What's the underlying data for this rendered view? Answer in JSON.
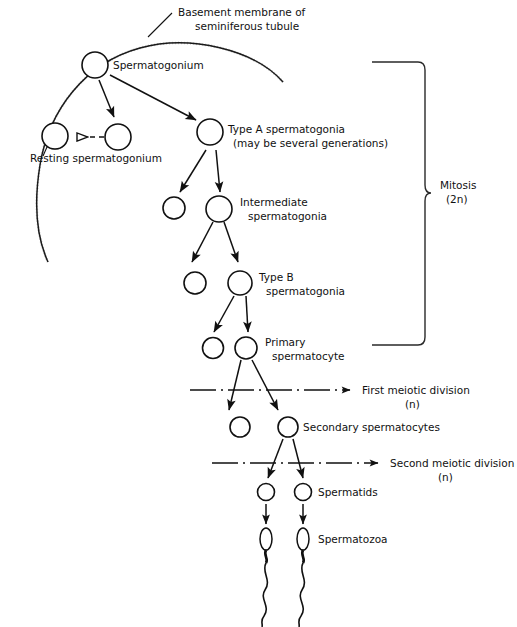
{
  "diagram": {
    "background_color": "#ffffff",
    "ink_color": "#111111",
    "labels": {
      "basement_membrane_line1": "Basement membrane of",
      "basement_membrane_line2": "seminiferous tubule",
      "spermatogonium": "Spermatogonium",
      "resting_spermatogonium": "Resting spermatogonium",
      "type_a_line1": "Type A spermatogonia",
      "type_a_line2": "(may be several generations)",
      "intermediate_line1": "Intermediate",
      "intermediate_line2": "spermatogonia",
      "type_b_line1": "Type B",
      "type_b_line2": "spermatogonia",
      "primary_line1": "Primary",
      "primary_line2": "spermatocyte",
      "first_meiotic_line1": "First meiotic division",
      "first_meiotic_line2": "(n)",
      "secondary_spermatocytes": "Secondary spermatocytes",
      "second_meiotic_line1": "Second meiotic division",
      "second_meiotic_line2": "(n)",
      "spermatids": "Spermatids",
      "spermatozoa": "Spermatozoa",
      "mitosis_line1": "Mitosis",
      "mitosis_line2": "(2n)"
    },
    "stages": [
      {
        "name": "spermatogonium",
        "label": "Spermatogonium",
        "ploidy": "2n",
        "division": "mitosis"
      },
      {
        "name": "resting-spermatogonium",
        "label": "Resting spermatogonium",
        "ploidy": "2n",
        "division": "mitosis"
      },
      {
        "name": "type-a-spermatogonia",
        "label": "Type A spermatogonia",
        "ploidy": "2n",
        "division": "mitosis"
      },
      {
        "name": "intermediate-spermatogonia",
        "label": "Intermediate spermatogonia",
        "ploidy": "2n",
        "division": "mitosis"
      },
      {
        "name": "type-b-spermatogonia",
        "label": "Type B spermatogonia",
        "ploidy": "2n",
        "division": "mitosis"
      },
      {
        "name": "primary-spermatocyte",
        "label": "Primary spermatocyte",
        "ploidy": "2n",
        "division": "mitosis"
      },
      {
        "name": "secondary-spermatocytes",
        "label": "Secondary spermatocytes",
        "ploidy": "n",
        "division": "first meiotic division"
      },
      {
        "name": "spermatids",
        "label": "Spermatids",
        "ploidy": "n",
        "division": "second meiotic division"
      },
      {
        "name": "spermatozoa",
        "label": "Spermatozoa",
        "ploidy": "n",
        "division": "spermiogenesis"
      }
    ]
  }
}
